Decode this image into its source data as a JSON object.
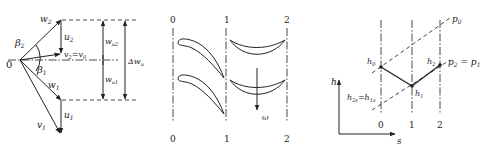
{
  "velocity_triangle": {
    "origin_label": "0",
    "beta2": "β",
    "beta2_sub": "2",
    "beta1": "β",
    "beta1_sub": "1",
    "w2": "w",
    "w2_sub": "2",
    "u2": "u",
    "u2_sub": "2",
    "v2_eq_v0": "v",
    "v2_eq_v0_sub": "2",
    "v2_eq_v0_rhs": "=v",
    "v2_eq_v0_rhs_sub": "0",
    "w1": "w",
    "w1_sub": "1",
    "u1": "u",
    "u1_sub": "1",
    "v1": "v",
    "v1_sub": "1",
    "wu2": "w",
    "wu2_sub": "u2",
    "wu1": "w",
    "wu1_sub": "u1",
    "delta_wu": "Δw",
    "delta_wu_sub": "u"
  },
  "cascade": {
    "stations_top": [
      "0",
      "1",
      "2"
    ],
    "stations_bottom": [
      "0",
      "1",
      "2"
    ],
    "omega": "ω"
  },
  "hs_diagram": {
    "axis_y": "h",
    "axis_x": "s",
    "stations": [
      "0",
      "1",
      "2"
    ],
    "h0": "h",
    "h0_sub": "0",
    "h1": "h",
    "h1_sub": "1",
    "h2": "h",
    "h2_sub": "2",
    "h2s_eq_h1s": "h",
    "h2s_sub": "2s",
    "h1s_eq": "=h",
    "h1s_sub": "1s",
    "p0": "p",
    "p0_sub": "0",
    "p2_eq_p1": "p",
    "p2_sub": "2",
    "p1_eq": " = p",
    "p1_sub": "1"
  }
}
